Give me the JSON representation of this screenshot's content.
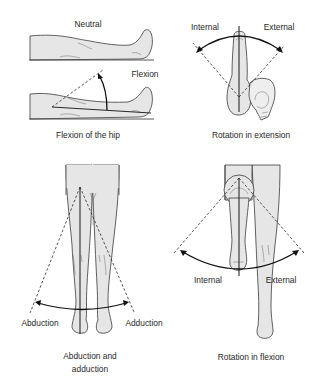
{
  "figure": {
    "panels": [
      {
        "id": "hip-flexion",
        "labels": {
          "top": "Neutral",
          "middle": "Flexion"
        },
        "caption": "Flexion of the hip"
      },
      {
        "id": "rotation-extension",
        "labels": {
          "left": "Internal",
          "right": "External"
        },
        "caption": "Rotation in extension"
      },
      {
        "id": "abduction-adduction",
        "labels": {
          "left": "Abduction",
          "right": "Adduction"
        },
        "caption_line1": "Abduction and",
        "caption_line2": "adduction"
      },
      {
        "id": "rotation-flexion",
        "labels": {
          "left": "Internal",
          "right": "External"
        },
        "caption": "Rotation in flexion"
      }
    ],
    "colors": {
      "skin": "#e6e6e6",
      "line": "#2a2a2a",
      "text": "#1f1f1f",
      "background": "#ffffff"
    }
  }
}
